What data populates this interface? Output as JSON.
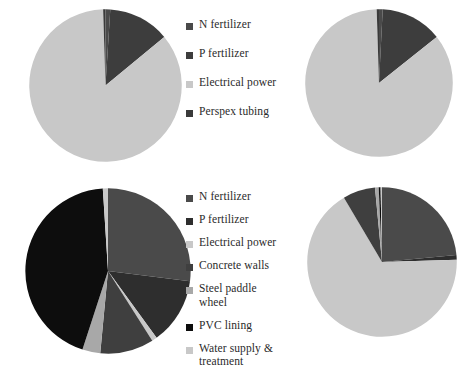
{
  "figure": {
    "background": "#ffffff",
    "panel_count": 4
  },
  "palette": {
    "n_fertilizer": "#4a4a4a",
    "p_fertilizer": "#3d3d3d",
    "electrical_power": "#c8c8c8",
    "perspex_tubing": "#3a3a3a",
    "concrete_walls": "#3f3f3f",
    "steel_paddle_wheel": "#a8a8a8",
    "pvc_lining": "#0d0d0d",
    "water_supply_treatment": "#c8c8c8"
  },
  "legends": {
    "top": {
      "name": "legend-top",
      "items": [
        {
          "label": "N fertilizer",
          "color": "#4a4a4a"
        },
        {
          "label": "P fertilizer",
          "color": "#3d3d3d"
        },
        {
          "label": "Electrical power",
          "color": "#c8c8c8"
        },
        {
          "label": "Perspex tubing",
          "color": "#3a3a3a"
        }
      ]
    },
    "bottom": {
      "name": "legend-bottom",
      "items": [
        {
          "label": "N fertilizer",
          "color": "#4a4a4a"
        },
        {
          "label": "P fertilizer",
          "color": "#2e2e2e"
        },
        {
          "label": "Electrical power",
          "color": "#c8c8c8"
        },
        {
          "label": "Concrete walls",
          "color": "#3f3f3f"
        },
        {
          "label": "Steel paddle\nwheel",
          "color": "#a8a8a8"
        },
        {
          "label": "PVC lining",
          "color": "#0d0d0d"
        },
        {
          "label": "Water supply &\ntreatment",
          "color": "#c8c8c8"
        }
      ]
    }
  },
  "chart_data": [
    {
      "type": "pie",
      "name": "pie-top-left",
      "title": "",
      "start_angle": 0,
      "labels": [
        "N fertilizer",
        "P fertilizer",
        "Electrical power",
        "Perspex tubing"
      ],
      "values": [
        1.0,
        13.0,
        85.5,
        0.5
      ],
      "colors": [
        "#4a4a4a",
        "#3d3d3d",
        "#c8c8c8",
        "#3a3a3a"
      ],
      "units": "percent"
    },
    {
      "type": "pie",
      "name": "pie-top-right",
      "title": "",
      "start_angle": 0,
      "labels": [
        "N fertilizer",
        "P fertilizer",
        "Electrical power",
        "Perspex tubing"
      ],
      "values": [
        0.8,
        13.5,
        85.2,
        0.5
      ],
      "colors": [
        "#4a4a4a",
        "#3d3d3d",
        "#c8c8c8",
        "#3a3a3a"
      ],
      "units": "percent"
    },
    {
      "type": "pie",
      "name": "pie-bottom-left",
      "title": "",
      "start_angle": 0,
      "labels": [
        "N fertilizer",
        "P fertilizer",
        "Electrical power",
        "Concrete walls",
        "Steel paddle wheel",
        "PVC lining",
        "Water supply & treatment"
      ],
      "values": [
        27.0,
        13.0,
        1.0,
        10.5,
        3.5,
        44.0,
        1.0
      ],
      "colors": [
        "#4a4a4a",
        "#2e2e2e",
        "#c8c8c8",
        "#3f3f3f",
        "#a8a8a8",
        "#0d0d0d",
        "#c8c8c8"
      ],
      "units": "percent"
    },
    {
      "type": "pie",
      "name": "pie-bottom-right",
      "title": "",
      "start_angle": 0,
      "labels": [
        "N fertilizer",
        "P fertilizer",
        "Electrical power",
        "Concrete walls",
        "Steel paddle wheel",
        "PVC lining",
        "Water supply & treatment"
      ],
      "values": [
        23.5,
        1.0,
        67.0,
        7.0,
        0.8,
        0.4,
        0.3
      ],
      "colors": [
        "#4a4a4a",
        "#2e2e2e",
        "#c8c8c8",
        "#3f3f3f",
        "#a8a8a8",
        "#0d0d0d",
        "#c8c8c8"
      ],
      "units": "percent"
    }
  ]
}
